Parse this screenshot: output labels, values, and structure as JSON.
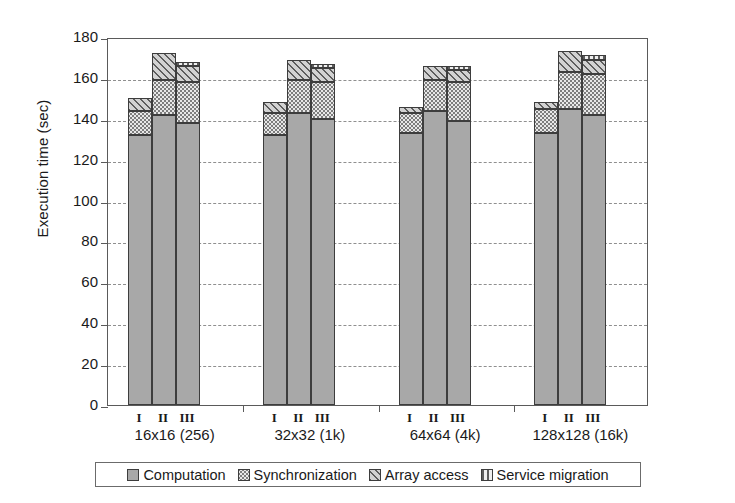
{
  "chart_data": {
    "type": "bar",
    "subtype": "stacked-grouped",
    "title": "",
    "xlabel": "",
    "ylabel": "Execution time (sec)",
    "ylim": [
      0,
      180
    ],
    "ytick_step": 20,
    "yticks": [
      0,
      20,
      40,
      60,
      80,
      100,
      120,
      140,
      160,
      180
    ],
    "grid": true,
    "grid_axis": "y",
    "legend_position": "bottom",
    "groups": [
      "16x16 (256)",
      "32x32 (1k)",
      "64x64 (4k)",
      "128x128 (16k)"
    ],
    "subcategories": [
      "I",
      "II",
      "III"
    ],
    "series": [
      {
        "name": "Computation",
        "pattern": "solid-gray",
        "color": "#a8a8a8",
        "values": [
          [
            132,
            142,
            138
          ],
          [
            132,
            143,
            140
          ],
          [
            133,
            144,
            139
          ],
          [
            133,
            145,
            142
          ]
        ]
      },
      {
        "name": "Synchronization",
        "pattern": "dotted",
        "color": "#e8e8e8",
        "values": [
          [
            12,
            17,
            20
          ],
          [
            11,
            16,
            18
          ],
          [
            10,
            15,
            19
          ],
          [
            12,
            18,
            20
          ]
        ]
      },
      {
        "name": "Array access",
        "pattern": "diagonal-hatch",
        "color": "#d2d2d2",
        "values": [
          [
            6,
            13,
            8
          ],
          [
            5,
            10,
            7
          ],
          [
            3,
            7,
            6
          ],
          [
            3,
            10,
            7
          ]
        ]
      },
      {
        "name": "Service migration",
        "pattern": "vertical-lines",
        "color": "#efefef",
        "values": [
          [
            0,
            0,
            2
          ],
          [
            0,
            0,
            2
          ],
          [
            0,
            0,
            2
          ],
          [
            0,
            0,
            2
          ]
        ]
      }
    ],
    "totals": [
      [
        150,
        172,
        168
      ],
      [
        148,
        169,
        167
      ],
      [
        146,
        166,
        166
      ],
      [
        148,
        173,
        171
      ]
    ],
    "legend": [
      {
        "label": "Computation",
        "pattern": "solid-gray"
      },
      {
        "label": "Synchronization",
        "pattern": "dotted"
      },
      {
        "label": "Array access",
        "pattern": "diagonal-hatch"
      },
      {
        "label": "Service migration",
        "pattern": "vertical-lines"
      }
    ]
  }
}
